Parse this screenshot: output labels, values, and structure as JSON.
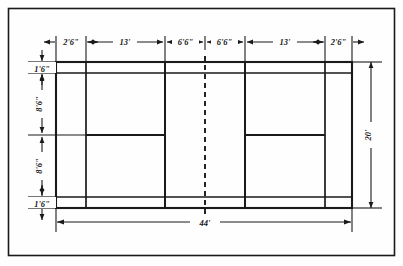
{
  "figure": {
    "line_color": "#1a1a1a",
    "background_color": "#fefefe",
    "net_style": "dashed"
  },
  "dimensions": {
    "top": [
      {
        "label": "2'6\"",
        "name": "left-alley-width"
      },
      {
        "label": "13'",
        "name": "left-service-court-depth"
      },
      {
        "label": "6'6\"",
        "name": "left-short-service-area"
      },
      {
        "label": "6'6\"",
        "name": "right-short-service-area"
      },
      {
        "label": "13'",
        "name": "right-service-court-depth"
      },
      {
        "label": "2'6\"",
        "name": "right-alley-width"
      }
    ],
    "left": [
      {
        "label": "1'6\"",
        "name": "top-doubles-sideline-offset"
      },
      {
        "label": "8'6\"",
        "name": "upper-half-court-width"
      },
      {
        "label": "8'6\"",
        "name": "lower-half-court-width"
      },
      {
        "label": "1'6\"",
        "name": "bottom-doubles-sideline-offset"
      }
    ],
    "right": [
      {
        "label": "20'",
        "name": "overall-court-width"
      }
    ],
    "bottom": [
      {
        "label": "44'",
        "name": "overall-court-length"
      }
    ]
  },
  "court": {
    "outer_left": 56,
    "outer_right": 352,
    "outer_top": 62,
    "outer_bottom": 208,
    "vertical_lines": [
      56,
      86,
      165,
      245,
      325,
      352
    ],
    "net_x": 205,
    "horizontal_lines": [
      62,
      73,
      135,
      197,
      208
    ],
    "inner_long_service_top": 73,
    "inner_long_service_bottom": 197,
    "center_line_y": 135,
    "short_service_left": 165,
    "short_service_right": 245
  },
  "frame": {
    "x": 8,
    "y": 8,
    "width": 387,
    "height": 248
  }
}
